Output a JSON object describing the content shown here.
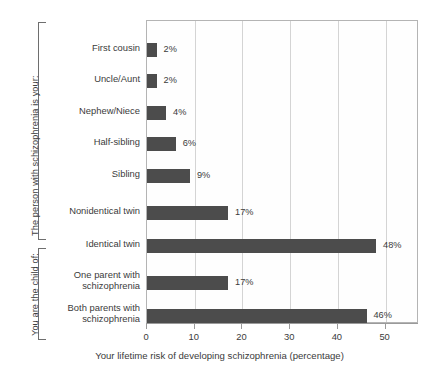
{
  "chart_data": {
    "type": "bar",
    "orientation": "horizontal",
    "title": "",
    "xlabel": "Your lifetime risk of developing schizophrenia (percentage)",
    "ylabel": "",
    "xlim": [
      0,
      57
    ],
    "xticks": [
      0,
      10,
      20,
      30,
      40,
      50
    ],
    "xtick_labels": [
      "0",
      "10",
      "20",
      "30",
      "40",
      "50"
    ],
    "grid": "vertical",
    "legend": "none",
    "bar_color": "#4c4c4c",
    "categories": [
      "First cousin",
      "Uncle/Aunt",
      "Nephew/Niece",
      "Half-sibling",
      "Sibling",
      "Nonidentical twin",
      "Identical twin",
      "One parent with schizophrenia",
      "Both parents with schizophrenia"
    ],
    "values": [
      2,
      2,
      4,
      6,
      9,
      17,
      48,
      17,
      46
    ],
    "value_labels": [
      "2%",
      "2%",
      "4%",
      "6%",
      "9%",
      "17%",
      "48%",
      "17%",
      "46%"
    ],
    "groups": [
      {
        "label": "The person with schizophrenia is your:",
        "categories": [
          "First cousin",
          "Uncle/Aunt",
          "Nephew/Niece",
          "Half-sibling",
          "Sibling",
          "Nonidentical twin",
          "Identical twin"
        ]
      },
      {
        "label": "You are the child of:",
        "categories": [
          "One parent with schizophrenia",
          "Both parents with schizophrenia"
        ]
      }
    ]
  },
  "categories_display": [
    {
      "lines": [
        "First cousin"
      ]
    },
    {
      "lines": [
        "Uncle/Aunt"
      ]
    },
    {
      "lines": [
        "Nephew/Niece"
      ]
    },
    {
      "lines": [
        "Half-sibling"
      ]
    },
    {
      "lines": [
        "Sibling"
      ]
    },
    {
      "lines": [
        "Nonidentical twin"
      ]
    },
    {
      "lines": [
        "Identical twin"
      ]
    },
    {
      "lines": [
        "One parent with",
        "schizophrenia"
      ]
    },
    {
      "lines": [
        "Both parents with",
        "schizophrenia"
      ]
    }
  ],
  "group_labels": {
    "top": "The person with schizophrenia is your:",
    "bottom": "You are the child of:"
  }
}
